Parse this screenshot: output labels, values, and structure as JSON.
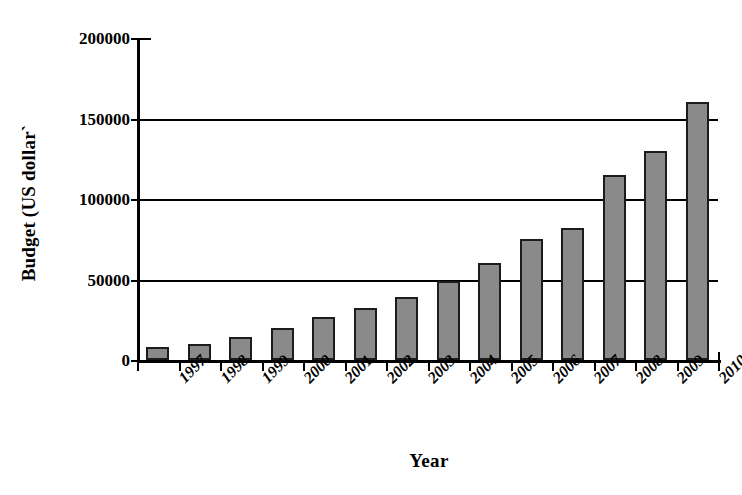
{
  "chart_data": {
    "type": "bar",
    "title": "",
    "xlabel": "Year",
    "ylabel": "Budget (US dollar)",
    "ylabel_display": "Budget (US dollar`",
    "categories": [
      "1997",
      "1998",
      "1999",
      "2000",
      "2001",
      "2002",
      "2003",
      "2004",
      "2005",
      "2006",
      "2007",
      "2008",
      "2009",
      "2010"
    ],
    "values": [
      8000,
      10000,
      14000,
      20000,
      27000,
      32000,
      39000,
      49000,
      60000,
      75000,
      82000,
      115000,
      130000,
      160000
    ],
    "series": [
      {
        "name": "Budget",
        "values": [
          8000,
          10000,
          14000,
          20000,
          27000,
          32000,
          39000,
          49000,
          60000,
          75000,
          82000,
          115000,
          130000,
          160000
        ]
      }
    ],
    "ylim": [
      0,
      200000
    ],
    "yticks": [
      0,
      50000,
      100000,
      150000,
      200000
    ],
    "ytick_labels": [
      "0",
      "50000",
      "100000",
      "150000",
      "200000"
    ],
    "grid": true,
    "grid_axis": "y",
    "legend": "none",
    "bar_color": "#8a8a8a",
    "bar_edge_color": "#1c1c1c",
    "axis_color": "#000000",
    "background_color": "#ffffff",
    "xtick_rotation": -45
  }
}
